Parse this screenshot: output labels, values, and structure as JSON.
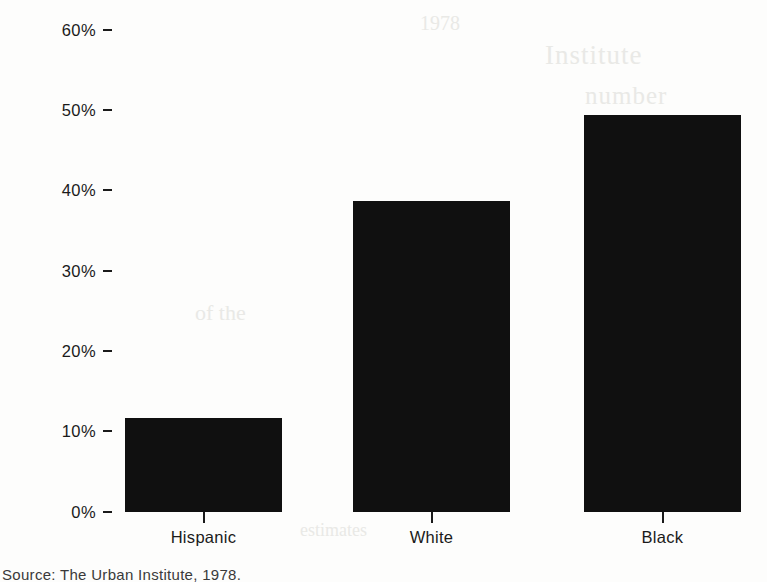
{
  "chart_data": {
    "type": "bar",
    "title": "",
    "subtitle": "",
    "xlabel": "",
    "ylabel": "",
    "categories": [
      "Hispanic",
      "White",
      "Black"
    ],
    "values": [
      11.7,
      38.7,
      49.4
    ],
    "series": [
      {
        "name": "Percent",
        "values": [
          11.7,
          38.7,
          49.4
        ]
      }
    ],
    "ylim": [
      0,
      60
    ],
    "ytick_labels": [
      "60%",
      "50%",
      "40%",
      "30%",
      "20%",
      "10%",
      "0%"
    ],
    "ytick_values": [
      60,
      50,
      40,
      30,
      20,
      10,
      0
    ],
    "grid": false,
    "legend": false,
    "legend_position": "none",
    "bar_color": "#101010",
    "axis_color": "#1a1a1a",
    "background_color": "#fdfdfc",
    "annotations": []
  },
  "figure": {
    "source_note": "Source:    The Urban Institute, 1978.",
    "ghost_text": {
      "a": "Institute",
      "b": "number",
      "c": "of the",
      "d": "estimates",
      "e": "1978"
    }
  }
}
